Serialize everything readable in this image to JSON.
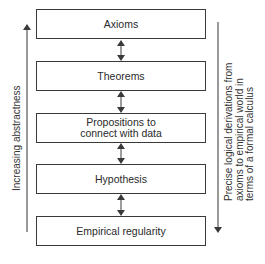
{
  "diagram": {
    "type": "hierarchy-flow",
    "boxes": [
      {
        "label": "Axioms"
      },
      {
        "label": "Theorems"
      },
      {
        "label": "Propositions to connect with data"
      },
      {
        "label": "Hypothesis"
      },
      {
        "label": "Empirical regularity"
      }
    ],
    "box_lines": {
      "propositions_line1": "Propositions to",
      "propositions_line2": "connect with data"
    },
    "connectors": "double-headed arrows between adjacent boxes",
    "left_axis": {
      "label": "Increasing abstractness",
      "direction": "up"
    },
    "right_axis": {
      "label_lines": [
        "Precise logical derivations from",
        "axioms to empirical world in",
        "terms of a formal calculus"
      ],
      "direction": "down"
    },
    "colors": {
      "line": "#3a3a3a",
      "text": "#2a2a2a",
      "background": "#ffffff"
    }
  }
}
